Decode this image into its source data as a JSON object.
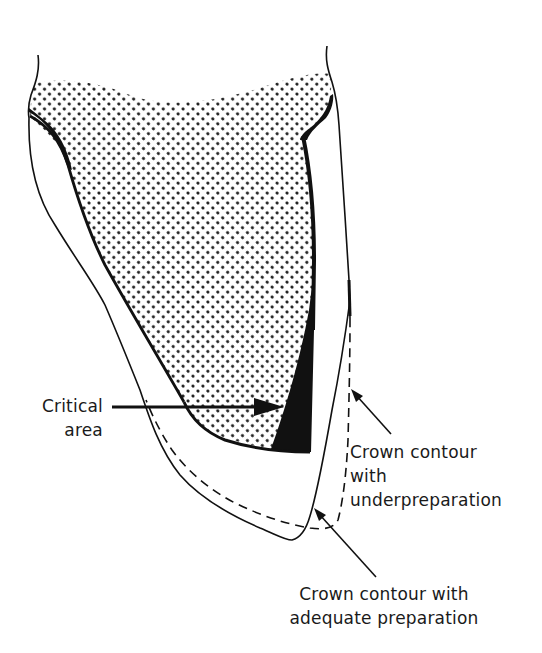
{
  "figure": {
    "colors": {
      "background": "#ffffff",
      "ink": "#111111",
      "stipple": "#1a1a1a"
    }
  },
  "labels": {
    "critical_area": {
      "line1": "Critical",
      "line2": "area"
    },
    "underpreparation": {
      "line1": "Crown contour",
      "line2": "with",
      "line3": "underpreparation"
    },
    "adequate_preparation": {
      "line1": "Crown contour with",
      "line2": "adequate preparation"
    }
  },
  "legend": {
    "solid_outline": "Crown contour with adequate preparation",
    "dashed_outline": "Crown contour with underpreparation",
    "stippled_region": "Tooth preparation (core)",
    "black_wedge": "Critical area"
  }
}
